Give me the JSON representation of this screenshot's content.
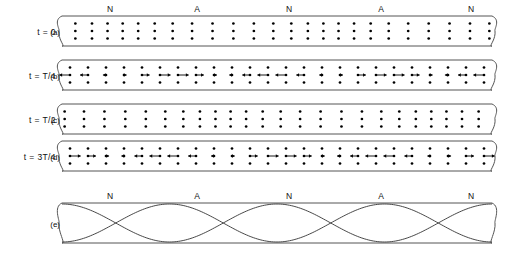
{
  "figure": {
    "tube": {
      "x_left": 62,
      "x_right": 492,
      "cap_rx": 6,
      "cap_ry": 10
    },
    "marker_labels": {
      "node": "N",
      "antinode": "A"
    },
    "marker_positions": [
      {
        "label": "N",
        "x": 110
      },
      {
        "label": "A",
        "x": 197
      },
      {
        "label": "N",
        "x": 289
      },
      {
        "label": "A",
        "x": 381
      },
      {
        "label": "N",
        "x": 471
      }
    ],
    "rows": [
      {
        "id": "a",
        "panel_label": "(a)",
        "time_label": "t = 0",
        "y_top": 16,
        "y_bottom": 46,
        "phase": 0,
        "show_arrows": false,
        "show_markers": true
      },
      {
        "id": "b",
        "panel_label": "(b)",
        "time_label": "t = T/4",
        "y_top": 60,
        "y_bottom": 90,
        "phase": 1,
        "show_arrows": true,
        "show_markers": false
      },
      {
        "id": "c",
        "panel_label": "(c)",
        "time_label": "t = T/2",
        "y_top": 104,
        "y_bottom": 134,
        "phase": 2,
        "show_arrows": false,
        "show_markers": false
      },
      {
        "id": "d",
        "panel_label": "(d)",
        "time_label": "t = 3T/4",
        "y_top": 141,
        "y_bottom": 171,
        "phase": 3,
        "show_arrows": true,
        "show_markers": false
      }
    ],
    "envelope_row": {
      "id": "e",
      "panel_label": "(e)",
      "time_label": "",
      "y_top": 203,
      "y_bottom": 243,
      "show_markers": true,
      "curve_count": 2,
      "half_wavelengths": 4
    },
    "dot_columns": 24,
    "dot_rows_per_column": 3,
    "displacement_amplitude_px": 5.5,
    "arrow_max_length_px": 11,
    "harmonic_half_waves": 4,
    "colors": {
      "outline": "#555555",
      "dot": "#000000",
      "arrow": "#000000",
      "wave": "#333333",
      "text": "#111111",
      "background": "#ffffff"
    }
  },
  "chart_data": {
    "type": "line",
    "xlabel": "",
    "ylabel": "",
    "series": [
      {
        "name": "envelope-positive",
        "description": "sin(4*pi*x/L) positive extreme"
      },
      {
        "name": "envelope-negative",
        "description": "sin(4*pi*x/L) negative extreme"
      }
    ],
    "nodes_normalized": [
      0.125,
      0.5,
      0.875
    ],
    "antinodes_normalized": [
      0.3125,
      0.6875
    ],
    "marker_sequence": [
      "N",
      "A",
      "N",
      "A",
      "N"
    ]
  }
}
